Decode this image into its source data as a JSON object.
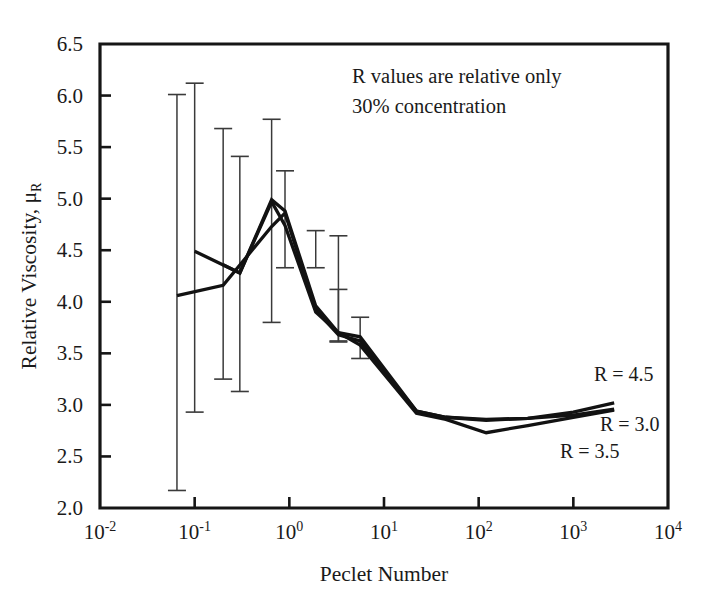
{
  "figure": {
    "width": 701,
    "height": 605,
    "background": "#ffffff",
    "ink_color": "#121212"
  },
  "annotations": {
    "line1": "R values are relative only",
    "line2": "30% concentration"
  },
  "series_labels": {
    "r45": "R = 4.5",
    "r30": "R = 3.0",
    "r35": "R = 3.5"
  },
  "axes": {
    "x_title": "Peclet Number",
    "y_title_main": "Relative Viscosity, ",
    "y_title_mu": "μ",
    "y_title_sub": "R",
    "x_tick_labels": [
      "10",
      "10",
      "10",
      "10",
      "10",
      "10",
      "10"
    ],
    "x_tick_exponents": [
      "-2",
      "-1",
      "0",
      "1",
      "2",
      "3",
      "4"
    ],
    "y_tick_labels": [
      "2.0",
      "2.5",
      "3.0",
      "3.5",
      "4.0",
      "4.5",
      "5.0",
      "5.5",
      "6.0",
      "6.5"
    ]
  },
  "chart_data": {
    "type": "line",
    "title": "",
    "xlabel": "Peclet Number",
    "ylabel": "Relative Viscosity, μR",
    "xscale": "log",
    "xlim": [
      0.01,
      10000
    ],
    "ylim": [
      2.0,
      6.5
    ],
    "ytick_values": [
      2.0,
      2.5,
      3.0,
      3.5,
      4.0,
      4.5,
      5.0,
      5.5,
      6.0,
      6.5
    ],
    "xtick_values": [
      0.01,
      0.1,
      1,
      10,
      100,
      1000,
      10000
    ],
    "grid": false,
    "legend": "inline-right",
    "annotation_text": [
      "R values are relative only",
      "30% concentration"
    ],
    "series": [
      {
        "name": "R = 4.5",
        "x": [
          0.065,
          0.2,
          0.65,
          0.9,
          1.9,
          3.3,
          5.6,
          22,
          45,
          120,
          330,
          1000,
          2700
        ],
        "y": [
          4.06,
          4.16,
          4.73,
          4.86,
          3.92,
          3.68,
          3.62,
          2.94,
          2.88,
          2.85,
          2.87,
          2.93,
          3.02
        ]
      },
      {
        "name": "R = 3.5",
        "x": [
          0.1,
          0.3,
          0.65,
          0.9,
          1.9,
          3.3,
          5.6,
          22,
          45,
          120,
          330,
          1000,
          2700
        ],
        "y": [
          4.49,
          4.28,
          4.97,
          4.74,
          3.9,
          3.7,
          3.58,
          2.92,
          2.86,
          2.73,
          2.8,
          2.88,
          2.95
        ]
      },
      {
        "name": "R = 3.0",
        "x": [
          0.2,
          0.3,
          0.65,
          0.9,
          1.9,
          3.3,
          5.6,
          22,
          45,
          120,
          330,
          1000,
          2700
        ],
        "y": [
          4.36,
          4.28,
          4.99,
          4.88,
          3.96,
          3.7,
          3.66,
          2.94,
          2.88,
          2.86,
          2.87,
          2.9,
          2.96
        ]
      }
    ],
    "error_bars": [
      {
        "x": 0.065,
        "y": 4.06,
        "upper": 6.01,
        "lower": 2.17
      },
      {
        "x": 0.1,
        "y": 4.49,
        "upper": 6.12,
        "lower": 2.93
      },
      {
        "x": 0.2,
        "y": 4.36,
        "upper": 5.68,
        "lower": 3.25
      },
      {
        "x": 0.3,
        "y": 4.28,
        "upper": 5.41,
        "lower": 3.13
      },
      {
        "x": 0.65,
        "y": 4.97,
        "upper": 5.77,
        "lower": 3.8
      },
      {
        "x": 0.9,
        "y": 4.86,
        "upper": 5.27,
        "lower": 4.33
      },
      {
        "x": 1.9,
        "y": 3.92,
        "upper": 4.69,
        "lower": 4.33
      },
      {
        "x": 3.3,
        "y": 3.7,
        "upper": 4.64,
        "lower": 3.62
      },
      {
        "x": 3.3,
        "y": 3.7,
        "upper": 4.12,
        "lower": 3.61
      },
      {
        "x": 5.6,
        "y": 3.62,
        "upper": 3.85,
        "lower": 3.45
      }
    ]
  }
}
